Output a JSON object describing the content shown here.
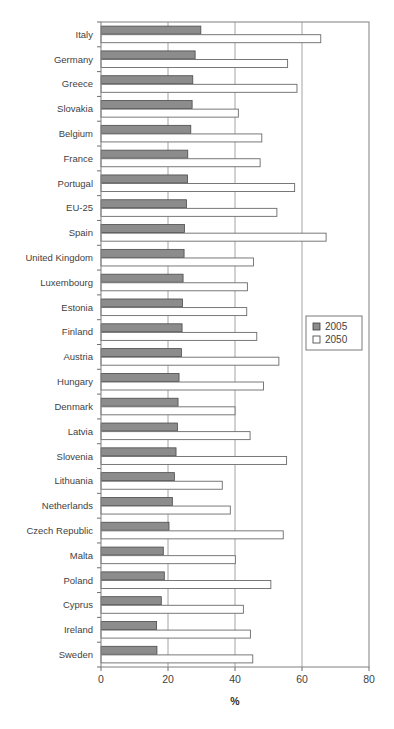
{
  "chart_data": {
    "type": "bar",
    "orientation": "horizontal",
    "title": "",
    "xlabel": "%",
    "ylabel": "",
    "xlim": [
      0,
      80
    ],
    "xticks": [
      0,
      20,
      40,
      60,
      80
    ],
    "xtick_labels": [
      "0",
      "20",
      "40",
      "60",
      "80"
    ],
    "grid": true,
    "grid_axis": "x",
    "legend": [
      "2005",
      "2050"
    ],
    "legend_position": "center-right",
    "categories": [
      "Italy",
      "Germany",
      "Greece",
      "Slovakia",
      "Belgium",
      "France",
      "Portugal",
      "EU-25",
      "Spain",
      "United Kingdom",
      "Luxembourg",
      "Estonia",
      "Finland",
      "Austria",
      "Hungary",
      "Denmark",
      "Latvia",
      "Slovenia",
      "Lithuania",
      "Netherlands",
      "Czech Republic",
      "Malta",
      "Poland",
      "Cyprus",
      "Ireland",
      "Sweden"
    ],
    "series": [
      {
        "name": "2005",
        "color": "#8c8c8c",
        "values": [
          29.8,
          28.1,
          27.4,
          27.2,
          26.8,
          25.9,
          25.8,
          25.5,
          24.9,
          24.8,
          24.5,
          24.3,
          24.2,
          24.0,
          23.3,
          23.0,
          22.8,
          22.4,
          21.9,
          21.3,
          20.3,
          18.6,
          18.9,
          18.0,
          16.6,
          16.7
        ]
      },
      {
        "name": "2050",
        "color": "#ffffff",
        "values": [
          65.6,
          55.7,
          58.5,
          41.0,
          48.0,
          47.5,
          57.8,
          52.5,
          67.2,
          45.5,
          43.7,
          43.5,
          46.5,
          53.1,
          48.5,
          40.0,
          44.5,
          55.4,
          36.2,
          38.6,
          54.4,
          40.1,
          50.7,
          42.5,
          44.6,
          45.3
        ]
      }
    ]
  },
  "legend": {
    "entries": [
      {
        "label": "2005",
        "swatch": "filled-gray-square-icon"
      },
      {
        "label": "2050",
        "swatch": "empty-white-square-icon"
      }
    ]
  },
  "axis": {
    "x_title": "%",
    "x_tick_labels": [
      "0",
      "20",
      "40",
      "60",
      "80"
    ]
  }
}
